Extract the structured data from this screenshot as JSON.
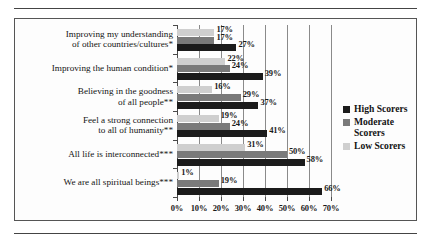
{
  "chart_data": {
    "type": "bar",
    "orientation": "horizontal",
    "title": "",
    "xlabel": "",
    "ylabel": "",
    "xlim": [
      0,
      70
    ],
    "xticks": [
      0,
      10,
      20,
      30,
      40,
      50,
      60,
      70
    ],
    "xtick_labels": [
      "0%",
      "10%",
      "20%",
      "30%",
      "40%",
      "50%",
      "60%",
      "70%"
    ],
    "grid": true,
    "legend_position": "right",
    "value_suffix": "%",
    "categories": [
      "Improving my understanding\nof other countries/cultures*",
      "Improving the human condition*",
      "Believing in the goodness\nof all people**",
      "Feel a strong connection\nto all of humanity**",
      "All life is interconnected***",
      "We are all spiritual beings***"
    ],
    "series": [
      {
        "name": "High Scorers",
        "color": "#1b1b1b",
        "values": [
          27,
          39,
          37,
          41,
          58,
          66
        ],
        "labels": [
          "27%",
          "39%",
          "37%",
          "41%",
          "58%",
          "66%"
        ]
      },
      {
        "name": "Moderate Scorers",
        "color": "#7a7a7a",
        "values": [
          17,
          24,
          29,
          24,
          50,
          19
        ],
        "labels": [
          "17%",
          "24%",
          "29%",
          "24%",
          "50%",
          "19%"
        ]
      },
      {
        "name": "Low Scorers",
        "color": "#cfcfcf",
        "values": [
          17,
          22,
          16,
          19,
          31,
          1
        ],
        "labels": [
          "17%",
          "22%",
          "16%",
          "19%",
          "31%",
          "1%"
        ]
      }
    ]
  },
  "legend": {
    "items": [
      {
        "label": "High Scorers",
        "swatch": "high"
      },
      {
        "label": "Moderate Scorers",
        "swatch": "moderate"
      },
      {
        "label": "Low Scorers",
        "swatch": "low"
      }
    ]
  }
}
